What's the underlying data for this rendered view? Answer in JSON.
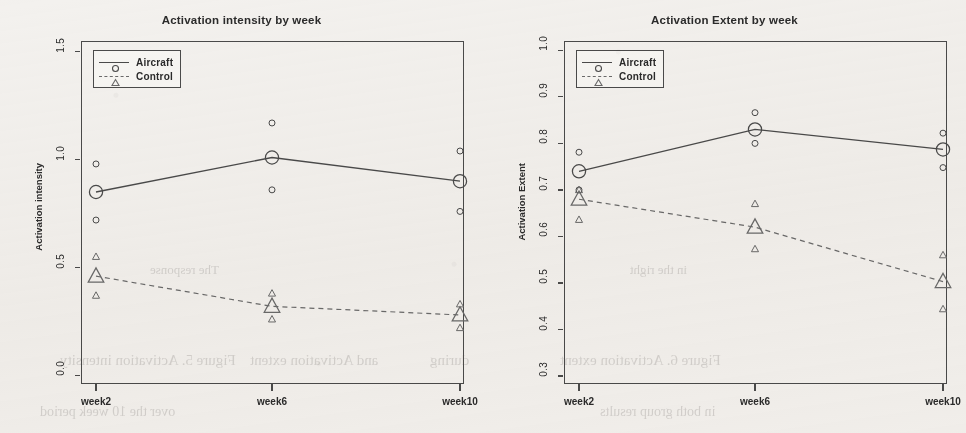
{
  "figure": {
    "background_color": "#f3f1ee",
    "ink_color": "#4a4a4a",
    "panel_count": 2
  },
  "bleedthrough": [
    {
      "text": "Figure 5. Activation intensity",
      "x": 60,
      "y": 352,
      "size": 15
    },
    {
      "text": "and Activation extent",
      "x": 250,
      "y": 352,
      "size": 15
    },
    {
      "text": "during",
      "x": 430,
      "y": 352,
      "size": 15
    },
    {
      "text": "Figure 6. Activation  extent",
      "x": 560,
      "y": 352,
      "size": 15
    },
    {
      "text": "over the 10 week period",
      "x": 40,
      "y": 404,
      "size": 14
    },
    {
      "text": "in both group  results",
      "x": 600,
      "y": 404,
      "size": 14
    },
    {
      "text": "The  response",
      "x": 150,
      "y": 262,
      "size": 13
    },
    {
      "text": "in the right",
      "x": 630,
      "y": 262,
      "size": 13
    }
  ],
  "chart_data": [
    {
      "type": "line",
      "panel_id": "activation-intensity",
      "title": "Activation intensity by week",
      "xlabel": "",
      "ylabel": "Activation intensity",
      "categories": [
        "week2",
        "week6",
        "week10"
      ],
      "ytick_labels": [
        "0.0",
        "0.5",
        "1.0",
        "1.5"
      ],
      "ytick_values": [
        0.0,
        0.5,
        1.0,
        1.5
      ],
      "ylim": [
        -0.04,
        1.55
      ],
      "grid": false,
      "legend_position": "top-left",
      "series": [
        {
          "name": "Aircraft",
          "marker": "circle",
          "linestyle": "solid",
          "color": "#4a4a4a",
          "values": [
            0.85,
            1.01,
            0.9
          ],
          "upper": [
            0.98,
            1.17,
            1.04
          ],
          "lower": [
            0.72,
            0.86,
            0.76
          ]
        },
        {
          "name": "Control",
          "marker": "triangle",
          "linestyle": "dashed",
          "color": "#6a6a6a",
          "values": [
            0.46,
            0.32,
            0.28
          ],
          "upper": [
            0.55,
            0.38,
            0.33
          ],
          "lower": [
            0.37,
            0.26,
            0.22
          ]
        }
      ]
    },
    {
      "type": "line",
      "panel_id": "activation-extent",
      "title": "Activation Extent by week",
      "xlabel": "",
      "ylabel": "Activation Extent",
      "categories": [
        "week2",
        "week6",
        "week10"
      ],
      "ytick_labels": [
        "0.3",
        "0.4",
        "0.5",
        "0.6",
        "0.7",
        "0.8",
        "0.9",
        "1.0"
      ],
      "ytick_values": [
        0.3,
        0.4,
        0.5,
        0.6,
        0.7,
        0.8,
        0.9,
        1.0
      ],
      "ylim": [
        0.283,
        1.02
      ],
      "grid": false,
      "legend_position": "top-left",
      "series": [
        {
          "name": "Aircraft",
          "marker": "circle",
          "linestyle": "solid",
          "color": "#4a4a4a",
          "values": [
            0.74,
            0.83,
            0.787
          ],
          "upper": [
            0.781,
            0.866,
            0.822
          ],
          "lower": [
            0.7,
            0.8,
            0.748
          ]
        },
        {
          "name": "Control",
          "marker": "triangle",
          "linestyle": "dashed",
          "color": "#6a6a6a",
          "values": [
            0.68,
            0.62,
            0.503
          ],
          "upper": [
            0.7,
            0.67,
            0.56
          ],
          "lower": [
            0.636,
            0.573,
            0.444
          ]
        }
      ]
    }
  ]
}
